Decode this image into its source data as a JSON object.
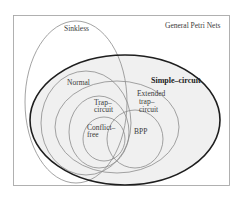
{
  "diagram": {
    "type": "euler-diagram",
    "universe_label": "General Petri Nets",
    "sets": [
      {
        "id": "sinkless",
        "label": "Sinkless"
      },
      {
        "id": "simple-circuit",
        "label": "Simple–circuit",
        "emphasis": "bold"
      },
      {
        "id": "normal",
        "label": "Normal"
      },
      {
        "id": "extended-trap-circuit",
        "label_lines": [
          "Extended",
          "trap–",
          "circuit"
        ]
      },
      {
        "id": "trap-circuit",
        "label_lines": [
          "Trap–",
          "circuit"
        ]
      },
      {
        "id": "conflict-free",
        "label_lines": [
          "Conflict–",
          "free"
        ]
      },
      {
        "id": "bpp",
        "label": "BPP"
      }
    ]
  },
  "colors": {
    "background": "#ffffff",
    "frame": "#a8a8a8",
    "thin_outline": "#8c8c8c",
    "bold_outline": "#1e1e1e",
    "simple_circuit_fill": "#f0f0f0"
  }
}
